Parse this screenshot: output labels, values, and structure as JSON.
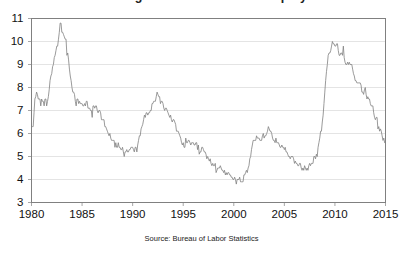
{
  "chart_data": {
    "type": "line",
    "title": "Percentage of Labor Force Unemployed",
    "subtitle": "",
    "xlabel": "",
    "ylabel": "",
    "source_note": "Source: Bureau of Labor Statistics",
    "grid": true,
    "legend": "none",
    "xlim": [
      1980,
      2015
    ],
    "ylim": [
      3,
      11
    ],
    "xticks": [
      "1980",
      "1985",
      "1990",
      "1995",
      "2000",
      "2005",
      "2010",
      "2015"
    ],
    "xtick_values": [
      1980,
      1985,
      1990,
      1995,
      2000,
      2005,
      2010,
      2015
    ],
    "yticks": [
      "3",
      "4",
      "5",
      "6",
      "7",
      "8",
      "9",
      "10",
      "11"
    ],
    "ytick_values": [
      3,
      4,
      5,
      6,
      7,
      8,
      9,
      10,
      11
    ],
    "line_color": "#808080",
    "grid_color": "#d9d9d9",
    "axis_color": "#808080",
    "background_color": "#ffffff",
    "series": [
      {
        "name": "Unemployment Rate",
        "x": [
          1980.0,
          1980.083,
          1980.167,
          1980.25,
          1980.333,
          1980.417,
          1980.5,
          1980.583,
          1980.667,
          1980.75,
          1980.833,
          1980.917,
          1981.0,
          1981.083,
          1981.167,
          1981.25,
          1981.333,
          1981.417,
          1981.5,
          1981.583,
          1981.667,
          1981.75,
          1981.833,
          1981.917,
          1982.0,
          1982.083,
          1982.167,
          1982.25,
          1982.333,
          1982.417,
          1982.5,
          1982.583,
          1982.667,
          1982.75,
          1982.833,
          1982.917,
          1983.0,
          1983.083,
          1983.167,
          1983.25,
          1983.333,
          1983.417,
          1983.5,
          1983.583,
          1983.667,
          1983.75,
          1983.833,
          1983.917,
          1984.0,
          1984.083,
          1984.167,
          1984.25,
          1984.333,
          1984.417,
          1984.5,
          1984.583,
          1984.667,
          1984.75,
          1984.833,
          1984.917,
          1985.0,
          1985.083,
          1985.167,
          1985.25,
          1985.333,
          1985.417,
          1985.5,
          1985.583,
          1985.667,
          1985.75,
          1985.833,
          1985.917,
          1986.0,
          1986.083,
          1986.167,
          1986.25,
          1986.333,
          1986.417,
          1986.5,
          1986.583,
          1986.667,
          1986.75,
          1986.833,
          1986.917,
          1987.0,
          1987.083,
          1987.167,
          1987.25,
          1987.333,
          1987.417,
          1987.5,
          1987.583,
          1987.667,
          1987.75,
          1987.833,
          1987.917,
          1988.0,
          1988.083,
          1988.167,
          1988.25,
          1988.333,
          1988.417,
          1988.5,
          1988.583,
          1988.667,
          1988.75,
          1988.833,
          1988.917,
          1989.0,
          1989.083,
          1989.167,
          1989.25,
          1989.333,
          1989.417,
          1989.5,
          1989.583,
          1989.667,
          1989.75,
          1989.833,
          1989.917,
          1990.0,
          1990.083,
          1990.167,
          1990.25,
          1990.333,
          1990.417,
          1990.5,
          1990.583,
          1990.667,
          1990.75,
          1990.833,
          1990.917,
          1991.0,
          1991.083,
          1991.167,
          1991.25,
          1991.333,
          1991.417,
          1991.5,
          1991.583,
          1991.667,
          1991.75,
          1991.833,
          1991.917,
          1992.0,
          1992.083,
          1992.167,
          1992.25,
          1992.333,
          1992.417,
          1992.5,
          1992.583,
          1992.667,
          1992.75,
          1992.833,
          1992.917,
          1993.0,
          1993.083,
          1993.167,
          1993.25,
          1993.333,
          1993.417,
          1993.5,
          1993.583,
          1993.667,
          1993.75,
          1993.833,
          1993.917,
          1994.0,
          1994.083,
          1994.167,
          1994.25,
          1994.333,
          1994.417,
          1994.5,
          1994.583,
          1994.667,
          1994.75,
          1994.833,
          1994.917,
          1995.0,
          1995.083,
          1995.167,
          1995.25,
          1995.333,
          1995.417,
          1995.5,
          1995.583,
          1995.667,
          1995.75,
          1995.833,
          1995.917,
          1996.0,
          1996.083,
          1996.167,
          1996.25,
          1996.333,
          1996.417,
          1996.5,
          1996.583,
          1996.667,
          1996.75,
          1996.833,
          1996.917,
          1997.0,
          1997.083,
          1997.167,
          1997.25,
          1997.333,
          1997.417,
          1997.5,
          1997.583,
          1997.667,
          1997.75,
          1997.833,
          1997.917,
          1998.0,
          1998.083,
          1998.167,
          1998.25,
          1998.333,
          1998.417,
          1998.5,
          1998.583,
          1998.667,
          1998.75,
          1998.833,
          1998.917,
          1999.0,
          1999.083,
          1999.167,
          1999.25,
          1999.333,
          1999.417,
          1999.5,
          1999.583,
          1999.667,
          1999.75,
          1999.833,
          1999.917,
          2000.0,
          2000.083,
          2000.167,
          2000.25,
          2000.333,
          2000.417,
          2000.5,
          2000.583,
          2000.667,
          2000.75,
          2000.833,
          2000.917,
          2001.0,
          2001.083,
          2001.167,
          2001.25,
          2001.333,
          2001.417,
          2001.5,
          2001.583,
          2001.667,
          2001.75,
          2001.833,
          2001.917,
          2002.0,
          2002.083,
          2002.167,
          2002.25,
          2002.333,
          2002.417,
          2002.5,
          2002.583,
          2002.667,
          2002.75,
          2002.833,
          2002.917,
          2003.0,
          2003.083,
          2003.167,
          2003.25,
          2003.333,
          2003.417,
          2003.5,
          2003.583,
          2003.667,
          2003.75,
          2003.833,
          2003.917,
          2004.0,
          2004.083,
          2004.167,
          2004.25,
          2004.333,
          2004.417,
          2004.5,
          2004.583,
          2004.667,
          2004.75,
          2004.833,
          2004.917,
          2005.0,
          2005.083,
          2005.167,
          2005.25,
          2005.333,
          2005.417,
          2005.5,
          2005.583,
          2005.667,
          2005.75,
          2005.833,
          2005.917,
          2006.0,
          2006.083,
          2006.167,
          2006.25,
          2006.333,
          2006.417,
          2006.5,
          2006.583,
          2006.667,
          2006.75,
          2006.833,
          2006.917,
          2007.0,
          2007.083,
          2007.167,
          2007.25,
          2007.333,
          2007.417,
          2007.5,
          2007.583,
          2007.667,
          2007.75,
          2007.833,
          2007.917,
          2008.0,
          2008.083,
          2008.167,
          2008.25,
          2008.333,
          2008.417,
          2008.5,
          2008.583,
          2008.667,
          2008.75,
          2008.833,
          2008.917,
          2009.0,
          2009.083,
          2009.167,
          2009.25,
          2009.333,
          2009.417,
          2009.5,
          2009.583,
          2009.667,
          2009.75,
          2009.833,
          2009.917,
          2010.0,
          2010.083,
          2010.167,
          2010.25,
          2010.333,
          2010.417,
          2010.5,
          2010.583,
          2010.667,
          2010.75,
          2010.833,
          2010.917,
          2011.0,
          2011.083,
          2011.167,
          2011.25,
          2011.333,
          2011.417,
          2011.5,
          2011.583,
          2011.667,
          2011.75,
          2011.833,
          2011.917,
          2012.0,
          2012.083,
          2012.167,
          2012.25,
          2012.333,
          2012.417,
          2012.5,
          2012.583,
          2012.667,
          2012.75,
          2012.833,
          2012.917,
          2013.0,
          2013.083,
          2013.167,
          2013.25,
          2013.333,
          2013.417,
          2013.5,
          2013.583,
          2013.667,
          2013.75,
          2013.833,
          2013.917,
          2014.0,
          2014.083,
          2014.167,
          2014.25,
          2014.333,
          2014.417,
          2014.5,
          2014.583,
          2014.667,
          2014.75,
          2014.833,
          2014.917
        ],
        "values": [
          6.3,
          6.3,
          6.3,
          6.9,
          7.5,
          7.6,
          7.8,
          7.7,
          7.5,
          7.5,
          7.5,
          7.2,
          7.5,
          7.4,
          7.4,
          7.2,
          7.5,
          7.5,
          7.2,
          7.4,
          7.6,
          7.9,
          8.3,
          8.5,
          8.6,
          8.9,
          9.0,
          9.3,
          9.4,
          9.6,
          9.8,
          9.8,
          10.1,
          10.4,
          10.8,
          10.8,
          10.4,
          10.4,
          10.3,
          10.2,
          10.1,
          10.1,
          9.4,
          9.5,
          9.2,
          8.8,
          8.5,
          8.3,
          8.0,
          7.8,
          7.8,
          7.7,
          7.4,
          7.2,
          7.5,
          7.5,
          7.3,
          7.4,
          7.3,
          7.3,
          7.3,
          7.2,
          7.2,
          7.3,
          7.2,
          7.4,
          7.4,
          7.1,
          7.1,
          7.1,
          7.0,
          7.0,
          6.7,
          7.2,
          7.2,
          7.1,
          7.2,
          7.2,
          7.0,
          6.9,
          7.0,
          7.0,
          6.9,
          6.6,
          6.6,
          6.6,
          6.6,
          6.3,
          6.3,
          6.2,
          6.1,
          6.0,
          5.9,
          6.0,
          5.8,
          5.7,
          5.7,
          5.7,
          5.7,
          5.4,
          5.6,
          5.4,
          5.4,
          5.6,
          5.4,
          5.4,
          5.3,
          5.3,
          5.4,
          5.2,
          5.0,
          5.2,
          5.2,
          5.3,
          5.2,
          5.2,
          5.3,
          5.3,
          5.4,
          5.4,
          5.4,
          5.3,
          5.2,
          5.4,
          5.4,
          5.2,
          5.5,
          5.7,
          5.9,
          5.9,
          6.2,
          6.3,
          6.4,
          6.6,
          6.8,
          6.7,
          6.9,
          6.9,
          6.8,
          6.9,
          6.9,
          7.0,
          7.0,
          7.3,
          7.3,
          7.4,
          7.4,
          7.4,
          7.6,
          7.8,
          7.7,
          7.6,
          7.6,
          7.3,
          7.4,
          7.4,
          7.3,
          7.1,
          7.0,
          7.1,
          7.1,
          7.0,
          6.9,
          6.8,
          6.7,
          6.8,
          6.6,
          6.5,
          6.6,
          6.6,
          6.5,
          6.4,
          6.1,
          6.1,
          6.1,
          6.0,
          5.9,
          5.8,
          5.6,
          5.5,
          5.6,
          5.4,
          5.4,
          5.8,
          5.6,
          5.6,
          5.7,
          5.7,
          5.6,
          5.5,
          5.6,
          5.6,
          5.6,
          5.5,
          5.5,
          5.6,
          5.6,
          5.3,
          5.5,
          5.1,
          5.2,
          5.2,
          5.4,
          5.4,
          5.3,
          5.2,
          5.2,
          5.1,
          4.9,
          5.0,
          4.9,
          4.8,
          4.9,
          4.7,
          4.6,
          4.7,
          4.6,
          4.6,
          4.7,
          4.3,
          4.4,
          4.5,
          4.5,
          4.5,
          4.6,
          4.5,
          4.4,
          4.4,
          4.3,
          4.4,
          4.2,
          4.3,
          4.2,
          4.3,
          4.3,
          4.2,
          4.2,
          4.1,
          4.1,
          4.0,
          4.0,
          4.1,
          4.0,
          3.8,
          4.0,
          4.0,
          4.0,
          4.1,
          3.9,
          3.9,
          3.9,
          3.9,
          4.2,
          4.2,
          4.3,
          4.4,
          4.3,
          4.5,
          4.6,
          4.9,
          5.0,
          5.3,
          5.5,
          5.7,
          5.7,
          5.7,
          5.7,
          5.9,
          5.8,
          5.8,
          5.8,
          5.7,
          5.7,
          5.7,
          5.9,
          6.0,
          5.8,
          5.9,
          5.9,
          6.0,
          6.1,
          6.3,
          6.2,
          6.1,
          6.1,
          6.0,
          5.8,
          5.7,
          5.7,
          5.6,
          5.8,
          5.6,
          5.6,
          5.6,
          5.5,
          5.4,
          5.4,
          5.5,
          5.4,
          5.4,
          5.3,
          5.4,
          5.2,
          5.2,
          5.1,
          5.0,
          5.0,
          4.9,
          5.0,
          5.0,
          5.0,
          4.9,
          4.7,
          4.8,
          4.7,
          4.7,
          4.6,
          4.6,
          4.7,
          4.7,
          4.5,
          4.4,
          4.5,
          4.4,
          4.6,
          4.5,
          4.4,
          4.5,
          4.4,
          4.6,
          4.7,
          4.6,
          4.7,
          4.7,
          4.7,
          5.0,
          5.0,
          4.9,
          5.1,
          5.0,
          5.4,
          5.6,
          5.8,
          6.1,
          6.1,
          6.5,
          6.8,
          7.3,
          7.8,
          8.3,
          8.7,
          9.0,
          9.4,
          9.5,
          9.5,
          9.6,
          9.8,
          10.0,
          9.9,
          9.9,
          9.8,
          9.8,
          9.9,
          9.9,
          9.6,
          9.4,
          9.4,
          9.5,
          9.5,
          9.4,
          9.8,
          9.3,
          9.1,
          9.0,
          9.0,
          9.1,
          9.0,
          9.1,
          9.0,
          9.0,
          9.0,
          8.8,
          8.6,
          8.5,
          8.3,
          8.3,
          8.2,
          8.2,
          8.2,
          8.2,
          8.2,
          8.1,
          7.8,
          7.8,
          7.7,
          7.9,
          8.0,
          7.7,
          7.5,
          7.6,
          7.5,
          7.5,
          7.3,
          7.2,
          7.2,
          7.2,
          6.9,
          6.7,
          6.6,
          6.7,
          6.7,
          6.2,
          6.3,
          6.1,
          6.2,
          6.1,
          5.9,
          5.7,
          5.8,
          5.6
        ]
      }
    ]
  },
  "axis": {
    "ytick_labels": [
      "11",
      "10",
      "9",
      "8",
      "7",
      "6",
      "5",
      "4",
      "3"
    ],
    "xtick_labels": [
      "1980",
      "1985",
      "1990",
      "1995",
      "2000",
      "2005",
      "2010",
      "2015"
    ]
  },
  "source": {
    "text": "Source: Bureau of Labor Statistics"
  },
  "title": {
    "text": "Percentage of Labor Force Unemployed"
  }
}
